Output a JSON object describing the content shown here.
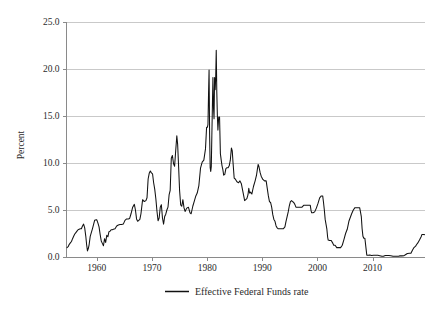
{
  "chart_data": {
    "type": "line",
    "title": "",
    "xlabel": "",
    "ylabel": "Percent",
    "xlim": [
      1954.5,
      2019.5
    ],
    "ylim": [
      0.0,
      25.0
    ],
    "grid": true,
    "legend_position": "bottom-center",
    "y_ticks": [
      "0.0",
      "5.0",
      "10.0",
      "15.0",
      "20.0",
      "25.0"
    ],
    "y_tick_values": [
      0.0,
      5.0,
      10.0,
      15.0,
      20.0,
      25.0
    ],
    "x_ticks": [
      "1960",
      "1970",
      "1980",
      "1990",
      "2000",
      "2010"
    ],
    "x_tick_values": [
      1960,
      1970,
      1980,
      1990,
      2000,
      2010
    ],
    "series": [
      {
        "name": "Effective Federal Funds rate",
        "color": "#111111",
        "x": [
          1954.6,
          1954.8,
          1955.0,
          1955.2,
          1955.4,
          1955.6,
          1955.8,
          1956.0,
          1956.2,
          1956.4,
          1956.6,
          1956.8,
          1957.0,
          1957.2,
          1957.4,
          1957.6,
          1957.8,
          1958.0,
          1958.15,
          1958.3,
          1958.45,
          1958.6,
          1958.8,
          1959.0,
          1959.2,
          1959.4,
          1959.6,
          1959.8,
          1960.0,
          1960.2,
          1960.4,
          1960.6,
          1960.8,
          1961.0,
          1961.2,
          1961.4,
          1961.6,
          1961.8,
          1962.0,
          1962.2,
          1962.4,
          1962.6,
          1962.8,
          1963.0,
          1963.3,
          1963.6,
          1963.9,
          1964.2,
          1964.5,
          1964.8,
          1965.1,
          1965.4,
          1965.7,
          1965.95,
          1966.2,
          1966.5,
          1966.8,
          1967.0,
          1967.2,
          1967.4,
          1967.6,
          1967.8,
          1968.0,
          1968.3,
          1968.6,
          1968.9,
          1969.1,
          1969.3,
          1969.5,
          1969.7,
          1969.9,
          1970.1,
          1970.3,
          1970.5,
          1970.7,
          1970.9,
          1971.1,
          1971.3,
          1971.5,
          1971.7,
          1971.9,
          1972.1,
          1972.3,
          1972.5,
          1972.7,
          1972.9,
          1973.1,
          1973.3,
          1973.5,
          1973.7,
          1973.9,
          1974.1,
          1974.3,
          1974.5,
          1974.65,
          1974.8,
          1975.0,
          1975.2,
          1975.4,
          1975.6,
          1975.8,
          1976.0,
          1976.3,
          1976.6,
          1976.9,
          1977.1,
          1977.4,
          1977.7,
          1977.95,
          1978.2,
          1978.5,
          1978.8,
          1979.1,
          1979.4,
          1979.7,
          1979.9,
          1980.05,
          1980.15,
          1980.25,
          1980.35,
          1980.45,
          1980.55,
          1980.65,
          1980.75,
          1980.85,
          1980.95,
          1981.05,
          1981.15,
          1981.25,
          1981.35,
          1981.45,
          1981.55,
          1981.65,
          1981.75,
          1981.85,
          1981.95,
          1982.1,
          1982.25,
          1982.4,
          1982.55,
          1982.7,
          1982.85,
          1983.0,
          1983.2,
          1983.4,
          1983.6,
          1983.8,
          1984.0,
          1984.2,
          1984.4,
          1984.55,
          1984.7,
          1984.9,
          1985.1,
          1985.4,
          1985.7,
          1985.95,
          1986.2,
          1986.5,
          1986.8,
          1987.0,
          1987.2,
          1987.4,
          1987.55,
          1987.7,
          1987.85,
          1988.1,
          1988.4,
          1988.7,
          1988.95,
          1989.1,
          1989.25,
          1989.4,
          1989.6,
          1989.8,
          1990.1,
          1990.4,
          1990.7,
          1990.9,
          1991.1,
          1991.3,
          1991.5,
          1991.7,
          1991.9,
          1992.1,
          1992.3,
          1992.5,
          1992.7,
          1992.9,
          1993.2,
          1993.5,
          1993.8,
          1994.1,
          1994.3,
          1994.5,
          1994.7,
          1994.9,
          1995.1,
          1995.3,
          1995.5,
          1995.7,
          1995.9,
          1996.1,
          1996.4,
          1996.7,
          1996.95,
          1997.2,
          1997.5,
          1997.8,
          1998.1,
          1998.4,
          1998.7,
          1998.85,
          1998.95,
          1999.2,
          1999.5,
          1999.8,
          2000.1,
          2000.4,
          2000.7,
          2000.95,
          2001.1,
          2001.25,
          2001.4,
          2001.55,
          2001.7,
          2001.85,
          2001.95,
          2002.2,
          2002.5,
          2002.8,
          2002.95,
          2003.2,
          2003.5,
          2003.8,
          2004.2,
          2004.5,
          2004.8,
          2005.1,
          2005.4,
          2005.7,
          2005.95,
          2006.2,
          2006.5,
          2006.8,
          2007.1,
          2007.4,
          2007.65,
          2007.8,
          2007.95,
          2008.1,
          2008.25,
          2008.4,
          2008.6,
          2008.8,
          2008.95,
          2009.2,
          2009.5,
          2009.8,
          2010.2,
          2010.6,
          2010.95,
          2011.3,
          2011.7,
          2011.95,
          2012.3,
          2012.7,
          2012.95,
          2013.3,
          2013.7,
          2013.95,
          2014.3,
          2014.7,
          2014.95,
          2015.3,
          2015.7,
          2015.95,
          2016.3,
          2016.7,
          2016.95,
          2017.2,
          2017.5,
          2017.8,
          2017.95,
          2018.2,
          2018.5,
          2018.8,
          2018.95,
          2019.2,
          2019.4
        ],
        "y": [
          1.0,
          1.1,
          1.35,
          1.5,
          1.65,
          1.95,
          2.2,
          2.45,
          2.6,
          2.75,
          2.9,
          2.95,
          3.0,
          3.0,
          3.3,
          3.5,
          3.1,
          2.2,
          1.3,
          0.65,
          0.9,
          1.3,
          2.2,
          2.6,
          3.0,
          3.45,
          3.9,
          3.95,
          3.95,
          3.6,
          3.2,
          2.4,
          1.7,
          1.45,
          1.2,
          1.95,
          1.55,
          2.3,
          2.15,
          2.7,
          2.75,
          2.9,
          2.9,
          2.95,
          3.0,
          3.3,
          3.4,
          3.45,
          3.45,
          3.5,
          3.9,
          4.05,
          4.05,
          4.1,
          4.6,
          5.3,
          5.6,
          5.0,
          4.05,
          3.8,
          3.9,
          4.0,
          4.6,
          6.1,
          5.9,
          6.0,
          6.3,
          8.3,
          8.9,
          9.15,
          8.95,
          8.85,
          7.9,
          7.2,
          6.2,
          4.9,
          3.85,
          4.15,
          5.3,
          5.55,
          4.15,
          3.5,
          4.3,
          4.55,
          5.0,
          5.3,
          6.6,
          7.1,
          10.5,
          10.8,
          9.95,
          9.65,
          11.3,
          12.9,
          12.0,
          10.0,
          7.1,
          5.55,
          5.4,
          6.1,
          5.25,
          4.85,
          5.2,
          5.3,
          4.7,
          4.6,
          5.4,
          6.0,
          6.5,
          6.8,
          7.6,
          9.45,
          10.1,
          10.3,
          11.5,
          13.8,
          13.8,
          14.1,
          17.2,
          19.9,
          13.0,
          9.5,
          9.1,
          9.6,
          12.8,
          15.9,
          19.1,
          15.9,
          14.7,
          19.1,
          17.8,
          19.0,
          22.0,
          17.6,
          15.1,
          13.5,
          14.9,
          14.9,
          11.0,
          10.3,
          9.7,
          9.3,
          8.7,
          8.8,
          9.4,
          9.5,
          9.5,
          9.7,
          10.3,
          11.6,
          11.3,
          10.0,
          8.4,
          8.3,
          8.0,
          7.9,
          8.1,
          7.8,
          6.9,
          6.0,
          6.1,
          6.2,
          6.6,
          7.3,
          6.8,
          6.9,
          6.7,
          7.5,
          8.1,
          8.7,
          9.3,
          9.85,
          9.6,
          9.0,
          8.6,
          8.25,
          8.1,
          8.1,
          7.3,
          6.5,
          5.9,
          5.8,
          5.3,
          4.5,
          4.0,
          3.8,
          3.3,
          3.1,
          3.0,
          3.0,
          3.0,
          3.0,
          3.2,
          3.8,
          4.3,
          4.8,
          5.45,
          5.9,
          6.0,
          5.9,
          5.8,
          5.6,
          5.3,
          5.3,
          5.3,
          5.3,
          5.3,
          5.5,
          5.5,
          5.5,
          5.5,
          5.5,
          4.9,
          4.7,
          4.7,
          4.8,
          5.2,
          5.7,
          6.3,
          6.5,
          6.5,
          5.8,
          5.0,
          4.0,
          3.5,
          3.0,
          2.1,
          1.8,
          1.75,
          1.75,
          1.45,
          1.25,
          1.25,
          1.0,
          1.0,
          1.0,
          1.25,
          1.85,
          2.5,
          2.95,
          3.8,
          4.2,
          4.6,
          5.0,
          5.25,
          5.25,
          5.25,
          5.25,
          4.8,
          4.3,
          3.0,
          2.2,
          2.0,
          2.0,
          0.95,
          0.2,
          0.18,
          0.2,
          0.15,
          0.18,
          0.18,
          0.18,
          0.14,
          0.08,
          0.07,
          0.15,
          0.15,
          0.16,
          0.14,
          0.09,
          0.08,
          0.09,
          0.09,
          0.12,
          0.12,
          0.14,
          0.24,
          0.37,
          0.4,
          0.4,
          0.7,
          1.0,
          1.15,
          1.3,
          1.5,
          1.8,
          2.15,
          2.4,
          2.4,
          2.38
        ]
      }
    ],
    "legend": [
      {
        "label": "Effective Federal Funds rate",
        "color": "#111111"
      }
    ]
  },
  "axes": {
    "y_title": "Percent"
  },
  "colors": {
    "line": "#111111",
    "grid": "#c9c9c9",
    "spine": "#8a8a8a",
    "text": "#2b2b2b",
    "background": "#ffffff"
  }
}
